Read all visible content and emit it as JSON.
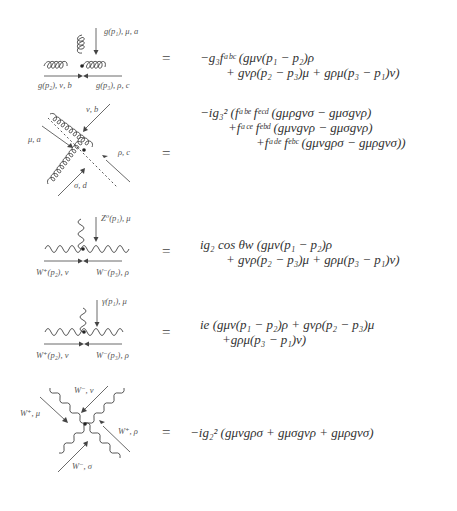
{
  "vertices": [
    {
      "name": "triple-gluon-vertex",
      "labels": {
        "top": "g(p₁), μ, a",
        "left": "g(p₂), ν, b",
        "right": "g(p₃), ρ, c"
      },
      "equals": "=",
      "equation_lines": [
        "−g₃fᵃᵇᶜ (gμν(p₁ − p₂)ρ",
        "+ gνρ(p₂ − p₃)μ + gρμ(p₃ − p₁)ν)"
      ]
    },
    {
      "name": "quartic-gluon-vertex",
      "labels": {
        "top_right": "ν, b",
        "left": "μ, a",
        "right": "ρ, c",
        "bottom": "σ, d"
      },
      "equals": "=",
      "equation_lines": [
        "−ig₃² (fᵃᵇᵉ fᵉᶜᵈ (gμρgνσ − gμσgνρ)",
        "+fᵃᶜᵉ fᵉᵇᵈ (gμνgνρ − gμσgνρ)",
        "+fᵃᵈᵉ fᵉᵇᶜ (gμνgρσ − gμρgνσ))"
      ]
    },
    {
      "name": "wwz-vertex",
      "labels": {
        "top": "Z⁰(p₁), μ",
        "left": "W⁺(p₂), ν",
        "right": "W⁻(p₃), ρ"
      },
      "equals": "=",
      "equation_lines": [
        "ig₂ cos θw (gμν(p₁ − p₂)ρ",
        "+ gνρ(p₂ − p₃)μ + gρμ(p₃ − p₁)ν)"
      ]
    },
    {
      "name": "ww-gamma-vertex",
      "labels": {
        "top": "γ(p₁), μ",
        "left": "W⁺(p₂), ν",
        "right": "W⁻(p₃), ρ"
      },
      "equals": "=",
      "equation_lines": [
        "ie (gμν(p₁ − p₂)ρ + gνρ(p₂ − p₃)μ",
        "+gρμ(p₃ − p₁)ν)"
      ]
    },
    {
      "name": "quartic-w-vertex",
      "labels": {
        "top": "W⁻, ν",
        "left": "W⁺, μ",
        "right": "W⁺, ρ",
        "bottom": "W⁻, σ"
      },
      "equals": "=",
      "equation_lines": [
        "−ig₂² (gμνgρσ + gμσgνρ + gμρgνσ)"
      ]
    }
  ]
}
